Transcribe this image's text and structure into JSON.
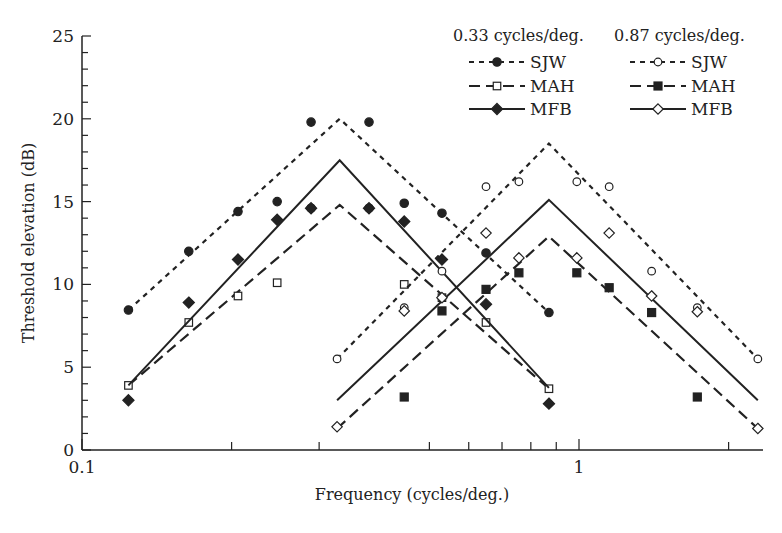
{
  "chart_data": {
    "type": "line",
    "title": "",
    "xlabel": "Frequency (cycles/deg.)",
    "ylabel": "Threshold elevation (dB)",
    "xscale": "log",
    "xlim": [
      0.1,
      2.5
    ],
    "ylim": [
      0,
      25
    ],
    "x_tick_labels": [
      {
        "value": 0.1,
        "label": "0.1"
      },
      {
        "value": 1,
        "label": "1"
      }
    ],
    "x_minor_ticks": [
      0.2,
      0.3,
      0.5,
      0.6,
      0.7,
      0.8,
      0.9,
      2
    ],
    "y_ticks": [
      0,
      5,
      10,
      15,
      20,
      25
    ],
    "y_minor_step": 1,
    "grid": false,
    "legend_position": "upper right",
    "legend_groups": [
      {
        "header": "0.33 cycles/deg.",
        "entries": [
          "SJW",
          "MAH",
          "MFB"
        ]
      },
      {
        "header": "0.87 cycles/deg.",
        "entries": [
          "SJW",
          "MAH",
          "MFB"
        ]
      }
    ],
    "series": [
      {
        "name": "SJW",
        "group": "0.33 cycles/deg.",
        "marker": "filled-circle",
        "line": "dotted",
        "fit_line": [
          [
            0.124,
            8.45
          ],
          [
            0.33,
            20.0
          ],
          [
            0.87,
            8.3
          ]
        ],
        "points": [
          [
            0.124,
            8.45
          ],
          [
            0.164,
            12.0
          ],
          [
            0.206,
            14.4
          ],
          [
            0.247,
            15.0
          ],
          [
            0.289,
            19.8
          ],
          [
            0.289,
            14.6
          ],
          [
            0.378,
            19.8
          ],
          [
            0.378,
            14.6
          ],
          [
            0.445,
            14.9
          ],
          [
            0.53,
            14.3
          ],
          [
            0.65,
            11.9
          ],
          [
            0.87,
            8.3
          ]
        ]
      },
      {
        "name": "MAH",
        "group": "0.33 cycles/deg.",
        "marker": "open-square",
        "line": "dashed",
        "fit_line": [
          [
            0.124,
            3.9
          ],
          [
            0.33,
            14.8
          ],
          [
            0.87,
            3.7
          ]
        ],
        "points": [
          [
            0.124,
            3.9
          ],
          [
            0.164,
            7.7
          ],
          [
            0.206,
            9.3
          ],
          [
            0.247,
            10.1
          ],
          [
            0.445,
            10.0
          ],
          [
            0.53,
            9.2
          ],
          [
            0.65,
            7.7
          ],
          [
            0.87,
            3.7
          ]
        ]
      },
      {
        "name": "MFB",
        "group": "0.33 cycles/deg.",
        "marker": "filled-diamond",
        "line": "solid",
        "fit_line": [
          [
            0.124,
            3.9
          ],
          [
            0.33,
            17.5
          ],
          [
            0.87,
            3.75
          ]
        ],
        "points": [
          [
            0.124,
            3.0
          ],
          [
            0.164,
            8.9
          ],
          [
            0.206,
            11.5
          ],
          [
            0.247,
            13.9
          ],
          [
            0.289,
            14.6
          ],
          [
            0.378,
            14.6
          ],
          [
            0.445,
            13.8
          ],
          [
            0.53,
            11.5
          ],
          [
            0.65,
            8.8
          ],
          [
            0.87,
            2.8
          ]
        ]
      },
      {
        "name": "SJW",
        "group": "0.87 cycles/deg.",
        "marker": "open-circle",
        "line": "dotted",
        "fit_line": [
          [
            0.326,
            5.5
          ],
          [
            0.87,
            18.5
          ],
          [
            2.29,
            5.5
          ]
        ],
        "points": [
          [
            0.326,
            5.5
          ],
          [
            0.445,
            8.6
          ],
          [
            0.53,
            10.8
          ],
          [
            0.65,
            15.9
          ],
          [
            0.757,
            16.2
          ],
          [
            0.99,
            16.2
          ],
          [
            1.15,
            15.9
          ],
          [
            1.4,
            10.8
          ],
          [
            1.73,
            8.6
          ],
          [
            2.29,
            5.5
          ]
        ]
      },
      {
        "name": "MAH",
        "group": "0.87 cycles/deg.",
        "marker": "filled-square",
        "line": "dashed",
        "fit_line": [
          [
            0.326,
            1.3
          ],
          [
            0.87,
            12.9
          ],
          [
            2.29,
            1.3
          ]
        ],
        "points": [
          [
            0.445,
            3.2
          ],
          [
            0.53,
            8.4
          ],
          [
            0.65,
            9.7
          ],
          [
            0.757,
            10.7
          ],
          [
            0.99,
            10.7
          ],
          [
            1.15,
            9.8
          ],
          [
            1.4,
            8.3
          ],
          [
            1.73,
            3.2
          ]
        ]
      },
      {
        "name": "MFB",
        "group": "0.87 cycles/deg.",
        "marker": "open-diamond",
        "line": "solid",
        "fit_line": [
          [
            0.326,
            3.0
          ],
          [
            0.87,
            15.1
          ],
          [
            2.29,
            3.0
          ]
        ],
        "points": [
          [
            0.326,
            1.4
          ],
          [
            0.445,
            8.4
          ],
          [
            0.53,
            9.2
          ],
          [
            0.65,
            13.1
          ],
          [
            0.757,
            11.6
          ],
          [
            0.99,
            11.6
          ],
          [
            1.15,
            13.1
          ],
          [
            1.4,
            9.3
          ],
          [
            1.73,
            8.35
          ],
          [
            2.29,
            1.3
          ]
        ]
      }
    ]
  },
  "colors": {
    "ink": "#222222",
    "background": "#ffffff"
  }
}
